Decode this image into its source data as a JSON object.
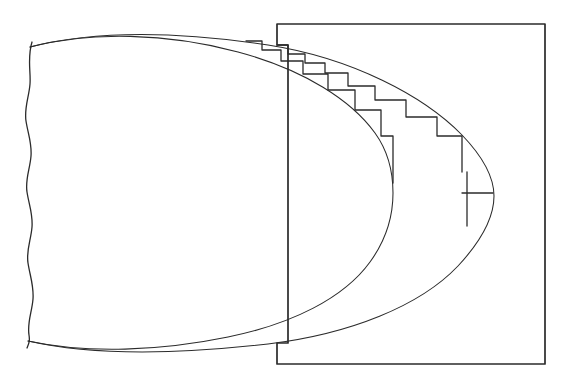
{
  "figure": {
    "type": "technical-line-drawing",
    "style": "hand-drawn",
    "canvas": {
      "width": 572,
      "height": 387
    },
    "background_color": "#ffffff",
    "ink_color": "#2b2b2b"
  },
  "frame": {
    "name": "outer-rectangle",
    "top_y": 24,
    "bottom_y": 364,
    "left_x": 277,
    "right_x": 545,
    "inner_shelf_top_y": 45,
    "inner_shelf_bottom_y": 343,
    "inner_shelf_left_x": 288,
    "path": "M 277 24 L 545 24 L 545 364 L 277 364 L 277 343 L 288 343 L 288 45 L 277 45 Z"
  },
  "break_line": {
    "name": "wavy-break-edge",
    "description": "Irregular hand-drawn vertical break line on the left margin",
    "top_y": 42,
    "bottom_y": 345,
    "nominal_x": 30,
    "path": "M 32 42 C 27 58 31 72 30 84 C 29 97 24 108 26 121 C 28 134 32 143 31 156 C 30 169 25 179 27 192 C 29 205 33 214 32 227 C 31 240 26 250 28 263 C 30 276 34 286 33 299 C 32 312 27 322 29 335 C 30 341 29 343 27 348"
  },
  "curves": [
    {
      "name": "outer-ellipse-arc",
      "description": "Large outer oval arc; rightmost vertex near x=494",
      "center": {
        "cx": 232,
        "cy": 195
      },
      "radii": {
        "rx": 262,
        "ry": 155
      },
      "right_vertex_x": 494,
      "path": "M 30 47 C 96 30 182 32 268 45 C 352 58 424 96 462 135 C 487 161 494 180 494 196 C 494 214 484 238 458 266 C 420 306 350 334 268 344 C 180 354 94 356 28 341"
    },
    {
      "name": "inner-ellipse-arc",
      "description": "Smaller inner oval arc; rightmost vertex near x=393",
      "center": {
        "cx": 210,
        "cy": 193
      },
      "radii": {
        "rx": 183,
        "ry": 152
      },
      "right_vertex_x": 393,
      "path": "M 30 47 C 90 31 168 33 238 52 C 305 70 352 101 375 133 C 388 151 393 172 393 193 C 393 216 386 240 370 262 C 344 298 292 324 228 337 C 160 351 88 354 28 341"
    }
  ],
  "staircases": [
    {
      "name": "outer-staircase",
      "description": "Stepped rectangular approximation following the outer elliptical arc",
      "step_count": 8,
      "path": "M 277 45 L 288 45 L 288 54 L 305 54 L 305 63 L 325 63 L 325 73 L 348 73 L 348 86 L 375 86 L 375 100 L 406 100 L 406 117 L 437 117 L 437 136 L 462 136 L 462 172"
    },
    {
      "name": "inner-staircase",
      "description": "Stepped rectangular approximation following the inner elliptical arc",
      "step_count": 7,
      "path": "M 246 41 L 262 41 L 262 50 L 281 50 L 281 61 L 303 61 L 303 74 L 328 74 L 328 90 L 355 90 L 355 110 L 381 110 L 381 136 L 393 136 L 393 183"
    }
  ],
  "dimension_marker": {
    "name": "leader-dimension-marker",
    "description": "Vertical tick with horizontal leader arm pointing right to the outer arc vertex",
    "vertical_x": 467,
    "vertical_top_y": 172,
    "vertical_bottom_y": 226,
    "arm_y": 193,
    "arm_from_x": 462,
    "arm_to_x": 493,
    "arrowhead": true
  }
}
